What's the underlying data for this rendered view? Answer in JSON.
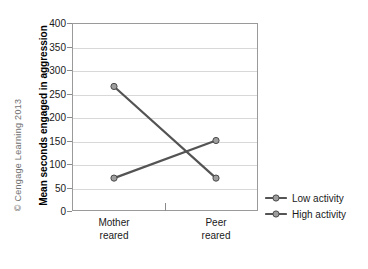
{
  "credit": "© Cengage Learning 2013",
  "chart_data": {
    "type": "line",
    "title": "",
    "xlabel": "",
    "ylabel": "Mean seconds engaged in aggression",
    "categories": [
      "Mother reared",
      "Peer reared"
    ],
    "category_lines": [
      [
        "Mother",
        "reared"
      ],
      [
        "Peer",
        "reared"
      ]
    ],
    "ylim": [
      0,
      400
    ],
    "yticks": [
      0,
      50,
      100,
      150,
      200,
      250,
      300,
      350,
      400
    ],
    "ytick_labels": [
      "0",
      "50",
      "100",
      "150",
      "200",
      "250",
      "300",
      "350",
      "400"
    ],
    "grid": true,
    "legend_position": "right",
    "series": [
      {
        "name": "Low activity",
        "values": [
          70,
          150
        ],
        "color": "#595959",
        "marker": "circle"
      },
      {
        "name": "High activity",
        "values": [
          265,
          70
        ],
        "color": "#4d4d4d",
        "marker": "circle"
      }
    ]
  },
  "legend": {
    "items": [
      {
        "label": "Low activity"
      },
      {
        "label": "High activity"
      }
    ]
  },
  "colors": {
    "frame": "#9a9a9a",
    "grid": "#d8d8d8",
    "line": "#545454",
    "marker_fill": "#9e9e9e",
    "marker_stroke": "#4a4a4a",
    "text": "#1a1a1a",
    "credit": "#6f6f6f"
  }
}
